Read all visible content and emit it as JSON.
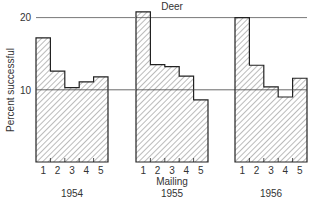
{
  "chart_data": {
    "type": "bar",
    "title": "Deer",
    "xlabel": "Mailing",
    "ylabel": "Percent successful",
    "ylim": [
      0,
      20
    ],
    "yticks": [
      10,
      20
    ],
    "reference_lines": [
      10,
      20
    ],
    "categories": [
      "1",
      "2",
      "3",
      "4",
      "5"
    ],
    "series": [
      {
        "name": "1954",
        "values": [
          17.2,
          12.6,
          10.3,
          11.1,
          11.8
        ]
      },
      {
        "name": "1955",
        "values": [
          20.8,
          13.5,
          13.2,
          11.9,
          8.6
        ]
      },
      {
        "name": "1956",
        "values": [
          20.0,
          13.4,
          10.4,
          9.0,
          11.6
        ]
      }
    ],
    "grid": false,
    "legend": "none"
  },
  "labels": {
    "title": "Deer",
    "xlabel": "Mailing",
    "ylabel": "Percent successful",
    "tick20": "20",
    "tick10": "10",
    "panels": [
      "1954",
      "1955",
      "1956"
    ]
  }
}
